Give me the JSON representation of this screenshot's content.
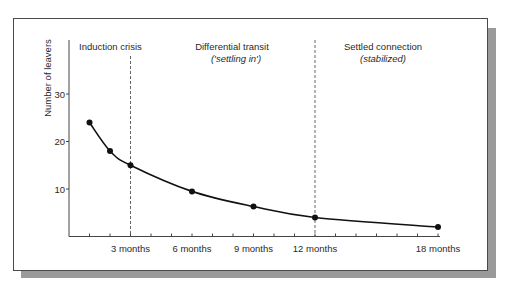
{
  "chart_data": {
    "type": "line",
    "title": "",
    "xlabel": "",
    "ylabel": "Number of leavers",
    "x_unit": "months",
    "x": [
      1,
      2,
      3,
      6,
      9,
      12,
      18
    ],
    "series": [
      {
        "name": "Number of leavers",
        "values": [
          24,
          18,
          15,
          9.5,
          6.3,
          4,
          2
        ]
      }
    ],
    "x_ticks": [
      {
        "value": 3,
        "label": "3 months"
      },
      {
        "value": 6,
        "label": "6 months"
      },
      {
        "value": 9,
        "label": "9 months"
      },
      {
        "value": 12,
        "label": "12 months"
      },
      {
        "value": 18,
        "label": "18 months"
      }
    ],
    "x_minor_ticks_every": 1,
    "y_ticks": [
      {
        "value": 10,
        "label": "10"
      },
      {
        "value": 20,
        "label": "20"
      },
      {
        "value": 30,
        "label": "30"
      }
    ],
    "xlim": [
      0,
      18
    ],
    "ylim": [
      0,
      41
    ],
    "grid": false,
    "legend": null,
    "phase_dividers": [
      3,
      12
    ],
    "annotations": [
      {
        "title": "Induction crisis",
        "subtitle": ""
      },
      {
        "title": "Differential transit",
        "subtitle": "('settling in')"
      },
      {
        "title": "Settled connection",
        "subtitle": "(stabilized)"
      }
    ]
  },
  "colors": {
    "line": "#111111",
    "axis": "#444444",
    "frame": "#4a4a4a",
    "shadow": "#9a9a9a",
    "divider": "#555555"
  }
}
